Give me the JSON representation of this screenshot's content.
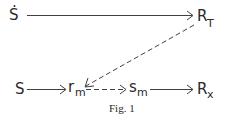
{
  "figure": {
    "caption": "Fig. 1",
    "nodes": {
      "s_dot": {
        "main": "S",
        "accent": "dot-above"
      },
      "r_t": {
        "main": "R",
        "sub": "T"
      },
      "s": {
        "main": "S"
      },
      "r_m": {
        "main": "r",
        "sub": "m"
      },
      "s_m": {
        "main": "s",
        "sub": "m"
      },
      "r_x": {
        "main": "R",
        "sub": "x"
      }
    },
    "edges": [
      {
        "from": "s_dot",
        "to": "r_t",
        "style": "solid"
      },
      {
        "from": "r_t",
        "to": "r_m",
        "style": "dashed"
      },
      {
        "from": "s",
        "to": "r_m",
        "style": "solid"
      },
      {
        "from": "r_m",
        "to": "s_m",
        "style": "dashed"
      },
      {
        "from": "s_m",
        "to": "r_x",
        "style": "solid"
      }
    ],
    "colors": {
      "ink": "#2a2a2a",
      "background": "#ffffff"
    }
  }
}
